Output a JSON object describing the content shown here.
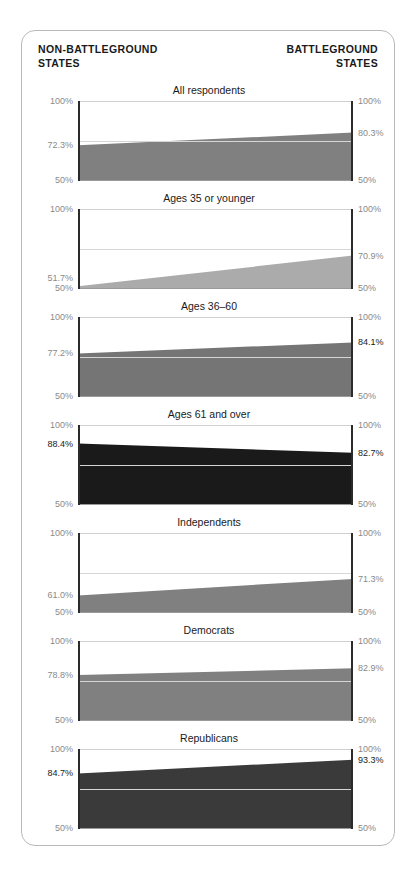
{
  "header": {
    "left_line1": "NON-BATTLEGROUND",
    "left_line2": "STATES",
    "right_line1": "BATTLEGROUND",
    "right_line2": "STATES"
  },
  "axis": {
    "top_label": "100%",
    "bottom_label": "50%"
  },
  "chart_data": {
    "type": "area",
    "title": "",
    "xlabel": "",
    "ylabel": "",
    "ylim": [
      50,
      100
    ],
    "gridline_at": 75,
    "grid": true,
    "legend_position": "none",
    "x_categories": [
      "Non-battleground states",
      "Battleground states"
    ],
    "series": [
      {
        "name": "All respondents",
        "left_value": 72.3,
        "right_value": 80.3,
        "left_label": "72.3%",
        "right_label": "80.3%",
        "color": "#808080",
        "left_label_dark": false,
        "right_label_dark": false
      },
      {
        "name": "Ages 35 or younger",
        "left_value": 51.7,
        "right_value": 70.9,
        "left_label": "51.7%",
        "right_label": "70.9%",
        "color": "#ababab",
        "left_label_dark": false,
        "right_label_dark": false
      },
      {
        "name": "Ages 36–60",
        "left_value": 77.2,
        "right_value": 84.1,
        "left_label": "77.2%",
        "right_label": "84.1%",
        "color": "#757575",
        "left_label_dark": false,
        "right_label_dark": true
      },
      {
        "name": "Ages 61 and over",
        "left_value": 88.4,
        "right_value": 82.7,
        "left_label": "88.4%",
        "right_label": "82.7%",
        "color": "#1a1a1a",
        "left_label_dark": true,
        "right_label_dark": true
      },
      {
        "name": "Independents",
        "left_value": 61.0,
        "right_value": 71.3,
        "left_label": "61.0%",
        "right_label": "71.3%",
        "color": "#808080",
        "left_label_dark": false,
        "right_label_dark": false
      },
      {
        "name": "Democrats",
        "left_value": 78.8,
        "right_value": 82.9,
        "left_label": "78.8%",
        "right_label": "82.9%",
        "color": "#808080",
        "left_label_dark": false,
        "right_label_dark": false
      },
      {
        "name": "Republicans",
        "left_value": 84.7,
        "right_value": 93.3,
        "left_label": "84.7%",
        "right_label": "93.3%",
        "color": "#3a3a3a",
        "left_label_dark": true,
        "right_label_dark": true
      }
    ]
  }
}
